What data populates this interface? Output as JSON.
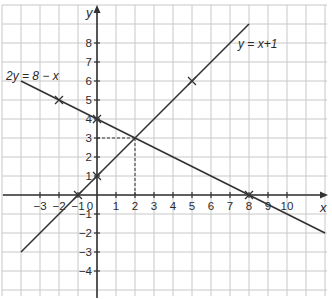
{
  "chart_data": {
    "type": "line",
    "title": "",
    "xlabel": "x",
    "ylabel": "y",
    "xlim": [
      -4.8,
      12.2
    ],
    "ylim": [
      -5.4,
      9.9
    ],
    "grid": true,
    "x_ticks": [
      -3,
      -2,
      -1,
      0,
      1,
      2,
      3,
      4,
      5,
      6,
      7,
      8,
      9,
      10
    ],
    "x_tick_labels": [
      "−3",
      "−2",
      "−1",
      "0",
      "1",
      "2",
      "3",
      "4",
      "5",
      "6",
      "7",
      "8",
      "9",
      "10"
    ],
    "y_ticks": [
      8,
      7,
      6,
      5,
      4,
      3,
      2,
      1,
      -1,
      -2,
      -3,
      -4
    ],
    "y_tick_labels": [
      "8",
      "7",
      "6",
      "5",
      "4",
      "3",
      "2",
      "1",
      "−1",
      "−2",
      "−3",
      "−4"
    ],
    "series": [
      {
        "name": "y = x + 1",
        "label": "y = x+1",
        "x": [
          -4,
          8
        ],
        "y": [
          -3,
          9
        ],
        "marked_points": [
          [
            5,
            6
          ],
          [
            -1,
            0
          ],
          [
            0,
            1
          ]
        ]
      },
      {
        "name": "2y = 8 − x",
        "label": "2y = 8 − x",
        "x": [
          -4,
          12
        ],
        "y": [
          6,
          -2
        ],
        "marked_points": [
          [
            -2,
            5
          ],
          [
            8,
            0
          ],
          [
            0,
            4
          ]
        ]
      }
    ],
    "annotations": [
      {
        "type": "intersection",
        "x": 2,
        "y": 3,
        "dashed_guides": true
      }
    ]
  }
}
